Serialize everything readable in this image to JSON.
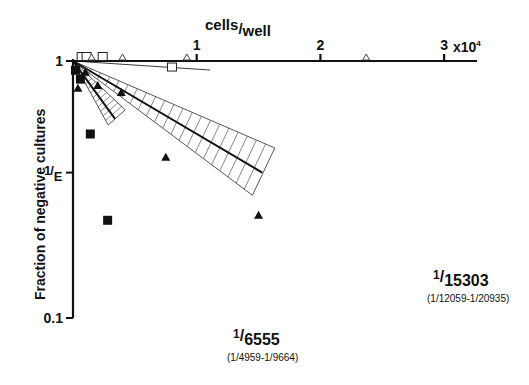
{
  "chart_data": {
    "type": "scatter",
    "title": "",
    "xlabel": "cells/well",
    "x_multiplier_label": "x10",
    "x_multiplier_exp": "4",
    "ylabel": "Fraction of negative cultures",
    "xlim": [
      0,
      3.3
    ],
    "ylim": [
      0.1,
      1
    ],
    "yscale": "log",
    "x_ticks": [
      {
        "value": 1,
        "label": "1"
      },
      {
        "value": 2,
        "label": "2"
      },
      {
        "value": 3,
        "label": "3"
      }
    ],
    "y_ticks": [
      {
        "value": 1,
        "label": "1"
      },
      {
        "value": 0.3679,
        "label_num": "1",
        "label_den": "E"
      },
      {
        "value": 0.1,
        "label": "0.1"
      }
    ],
    "grid": false,
    "legend": "none",
    "series": [
      {
        "name": "1/6555",
        "marker": "filled-square",
        "frequency": 6555,
        "ci_low": 4959,
        "ci_high": 9664,
        "label_main_num": "1",
        "label_main_den": "6555",
        "label_ci": [
          "1",
          "4959",
          "1",
          "9664"
        ],
        "points": [
          [
            0.02,
            0.92
          ],
          [
            0.06,
            0.85
          ],
          [
            0.14,
            0.52
          ],
          [
            0.28,
            0.24
          ]
        ]
      },
      {
        "name": "1/15303",
        "marker": "filled-triangle",
        "frequency": 15303,
        "ci_low": 12059,
        "ci_high": 20935,
        "label_main_num": "1",
        "label_main_den": "15303",
        "label_ci": [
          "1",
          "12059",
          "1",
          "20935"
        ],
        "points": [
          [
            0.03,
            0.94
          ],
          [
            0.1,
            0.9
          ],
          [
            0.04,
            0.78
          ],
          [
            0.2,
            0.8
          ],
          [
            0.39,
            0.75
          ],
          [
            0.75,
            0.42
          ],
          [
            1.5,
            0.25
          ]
        ]
      },
      {
        "name": "control-squares",
        "marker": "open-square",
        "points": [
          [
            0.07,
            1.0
          ],
          [
            0.11,
            1.0
          ],
          [
            0.24,
            1.0
          ],
          [
            0.8,
            0.91
          ]
        ]
      },
      {
        "name": "control-triangles",
        "marker": "open-triangle",
        "points": [
          [
            0.15,
            1.0
          ],
          [
            0.4,
            1.0
          ],
          [
            0.92,
            1.0
          ],
          [
            2.37,
            1.0
          ]
        ]
      }
    ]
  }
}
